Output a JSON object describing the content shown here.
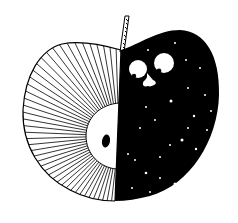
{
  "illustration": {
    "title": "Apple split into day and night",
    "description": "Line-art apple: left half with radiating hatched lines, white core and black seed; right half solid black with white stars and a peeking face with two eyes and a nose.",
    "colors": {
      "background": "#ffffff",
      "ink": "#000000",
      "highlight": "#ffffff"
    },
    "elements": {
      "stem": "stem",
      "left_half": "radiating-lines-half",
      "core": "apple-core",
      "seed": "seed",
      "right_half": "night-sky-half",
      "eyes": "eyes",
      "nose": "nose",
      "stars": "stars"
    }
  }
}
